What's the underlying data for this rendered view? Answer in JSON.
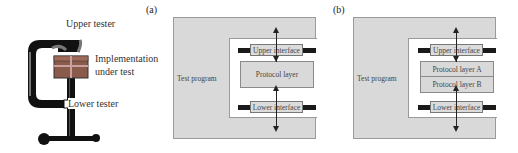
{
  "clamp_illustration": {
    "upper_tester_label": "Upper tester",
    "iut_label_line1": "Implementation",
    "iut_label_line2": "under test",
    "lower_tester_label": "Lower tester"
  },
  "panel_a": {
    "tag": "(a)",
    "test_program_label": "Test program",
    "upper_interface_label": "Upper interface",
    "protocol_layer_label": "Protocol layer",
    "lower_interface_label": "Lower interface"
  },
  "panel_b": {
    "tag": "(b)",
    "test_program_label": "Test program",
    "upper_interface_label": "Upper interface",
    "protocol_layer_a_label": "Protocol layer A",
    "protocol_layer_b_label": "Protocol layer B",
    "lower_interface_label": "Lower interface"
  },
  "colors": {
    "frame_fill": "#d9d9d9",
    "bar": "#1a1a1a",
    "clamp_body": "#111111",
    "package": "#8a5a4a"
  }
}
